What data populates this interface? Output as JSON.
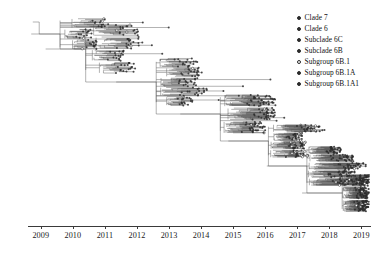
{
  "figure": {
    "type": "phylogenetic-tree",
    "style": "time-scaled rectangular cladogram",
    "palette": {
      "branch": "#555555",
      "tip": "#2b2b2b",
      "axis": "#3a3a3a",
      "background": "#ffffff"
    }
  },
  "axis": {
    "label": "",
    "orientation": "horizontal",
    "ticks": [
      {
        "value": 2009,
        "label": "2009"
      },
      {
        "value": 2010,
        "label": "2010"
      },
      {
        "value": 2011,
        "label": "2011"
      },
      {
        "value": 2012,
        "label": "2012"
      },
      {
        "value": 2013,
        "label": "2013"
      },
      {
        "value": 2014,
        "label": "2014"
      },
      {
        "value": 2015,
        "label": "2015"
      },
      {
        "value": 2016,
        "label": "2016"
      },
      {
        "value": 2017,
        "label": "2017"
      },
      {
        "value": 2018,
        "label": "2018"
      },
      {
        "value": 2019,
        "label": "2019"
      }
    ],
    "range": [
      2008.6,
      2019.3
    ]
  },
  "legend": {
    "position": "top-right",
    "items": [
      {
        "label": "Clade 7",
        "marker": "filled-circle",
        "color": "#2b2b2b"
      },
      {
        "label": "Clade 6",
        "marker": "filled-circle",
        "color": "#2b2b2b"
      },
      {
        "label": "Subclade 6C",
        "marker": "filled-circle",
        "color": "#2b2b2b"
      },
      {
        "label": "Subclade 6B",
        "marker": "filled-circle",
        "color": "#2b2b2b"
      },
      {
        "label": "Subgroup 6B.1",
        "marker": "open-circle",
        "color": "#2b2b2b"
      },
      {
        "label": "Subgroup 6B.1A",
        "marker": "filled-circle",
        "color": "#2b2b2b"
      },
      {
        "label": "Subgroup 6B.1A1",
        "marker": "filled-circle",
        "color": "#2b2b2b"
      }
    ]
  },
  "chart_data": {
    "type": "line",
    "title": "",
    "xlabel": "",
    "ylabel": "",
    "xlim": [
      2008.6,
      2019.3
    ],
    "grid": false,
    "legend_position": "top-right",
    "clusters": [
      {
        "name": "Clade 7",
        "x_center": 2009.6,
        "y_band": [
          0.02,
          0.18
        ],
        "tip_count": 46
      },
      {
        "name": "Clade 6",
        "x_center": 2010.4,
        "y_band": [
          0.05,
          0.3
        ],
        "tip_count": 70
      },
      {
        "name": "Subclade 6C",
        "x_center": 2012.6,
        "y_band": [
          0.22,
          0.46
        ],
        "tip_count": 88
      },
      {
        "name": "Subclade 6B",
        "x_center": 2014.6,
        "y_band": [
          0.4,
          0.6
        ],
        "tip_count": 105
      },
      {
        "name": "Subgroup 6B.1",
        "x_center": 2016.1,
        "y_band": [
          0.55,
          0.72
        ],
        "tip_count": 120
      },
      {
        "name": "Subgroup 6B.1A",
        "x_center": 2017.3,
        "y_band": [
          0.66,
          0.86
        ],
        "tip_count": 165
      },
      {
        "name": "Subgroup 6B.1A1",
        "x_center": 2018.4,
        "y_band": [
          0.8,
          0.99
        ],
        "tip_count": 190
      }
    ]
  }
}
